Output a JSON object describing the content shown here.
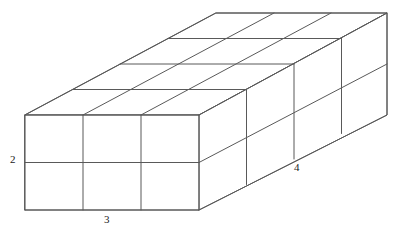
{
  "figure": {
    "shape": "rectangular prism built from unit cubes",
    "stroke_color": "#595959",
    "fill_color": "#ffffff",
    "background_color": "#ffffff",
    "stroke_width": 1
  },
  "labels": {
    "height": "2",
    "width": "3",
    "depth": "4"
  },
  "dimensions": {
    "width_units": 3,
    "height_units": 2,
    "depth_units": 4,
    "total_cubes": 24
  },
  "geometry": {
    "front_top_left_x": 25,
    "front_top_left_y": 115,
    "unit_x": 58,
    "unit_y": 47.5,
    "depth_dx": 47.5,
    "depth_dy": -25.5
  }
}
